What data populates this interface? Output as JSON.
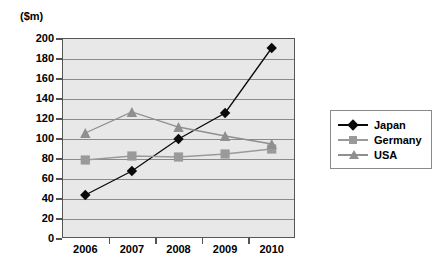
{
  "chart_data": {
    "type": "line",
    "title": "",
    "subtitle": "",
    "xlabel": "",
    "ylabel": "($m)",
    "unit_label": "($m)",
    "categories": [
      "2006",
      "2007",
      "2008",
      "2009",
      "2010"
    ],
    "x": [
      2006,
      2007,
      2008,
      2009,
      2010
    ],
    "series": [
      {
        "name": "Japan",
        "values": [
          43,
          67,
          99,
          125,
          190
        ],
        "color": "#0a0a0a",
        "marker": "diamond"
      },
      {
        "name": "Germany",
        "values": [
          78,
          82,
          81,
          84,
          89
        ],
        "color": "#9a9a9a",
        "marker": "square"
      },
      {
        "name": "USA",
        "values": [
          105,
          126,
          111,
          102,
          94
        ],
        "color": "#8f8f8f",
        "marker": "triangle"
      }
    ],
    "ylim": [
      0,
      200
    ],
    "ytick_values": [
      0,
      20,
      40,
      60,
      80,
      100,
      120,
      140,
      160,
      180,
      200
    ],
    "ytick_labels": [
      "0",
      "20",
      "40",
      "60",
      "80",
      "100",
      "120",
      "140",
      "160",
      "180",
      "200"
    ],
    "xtick_labels": [
      "2006",
      "2007",
      "2008",
      "2009",
      "2010"
    ],
    "grid": true,
    "grid_axis": "y",
    "legend_position": "right",
    "plot_background": "#e8e8e8",
    "gridline_color": "#8a8a8a",
    "axis_color": "#555555",
    "legend_entries": [
      "Japan",
      "Germany",
      "USA"
    ]
  }
}
